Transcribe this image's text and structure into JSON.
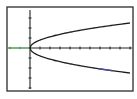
{
  "screen": {
    "type": "graphing-calculator-graph",
    "background": "#ffffff",
    "frame_color": "#3a3a3a",
    "frame": {
      "x": 7,
      "y": 7,
      "w": 126,
      "h": 84
    }
  },
  "graph": {
    "origin_px": {
      "x": 30,
      "y": 48
    },
    "x_axis": {
      "y": 48,
      "x_start": 8,
      "x_end": 132,
      "tick_spacing_px": 10,
      "color": "#222222",
      "negative_side_color": "#3c8a3c"
    },
    "y_axis": {
      "x": 30,
      "y_start": 10,
      "y_end": 89,
      "tick_spacing_px": 10,
      "color": "#222222"
    },
    "curves": [
      {
        "name": "upper-branch",
        "equation": "y = sqrt(x)",
        "sign": 1,
        "amplitude_px_at_100": 25,
        "x_end_px": 130,
        "color": "#1e1e1e"
      },
      {
        "name": "lower-branch",
        "equation": "y = -sqrt(x)",
        "sign": -1,
        "amplitude_px_at_100": 25,
        "x_end_px": 130,
        "color": "#1e1e1e",
        "highlight": {
          "x_from": 98,
          "x_to": 112,
          "color": "#4a4aa0"
        }
      }
    ]
  }
}
